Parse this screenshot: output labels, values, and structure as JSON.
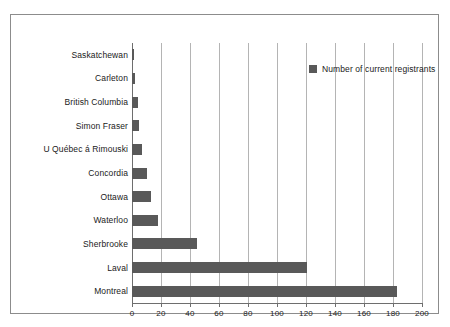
{
  "chart_data": {
    "type": "bar",
    "orientation": "horizontal",
    "title": "",
    "xlabel": "",
    "ylabel": "",
    "xlim": [
      0,
      200
    ],
    "xticks": [
      0,
      20,
      40,
      60,
      80,
      100,
      120,
      140,
      160,
      180,
      200
    ],
    "grid": true,
    "legend": {
      "position": "top-right-inside",
      "entries": [
        {
          "label": "Number of current registrants",
          "color": "#595959"
        }
      ]
    },
    "series": [
      {
        "name": "Number of current registrants",
        "color": "#595959",
        "values": [
          1,
          2,
          4,
          5,
          7,
          10,
          13,
          18,
          45,
          121,
          183
        ]
      }
    ],
    "categories": [
      "Saskatchewan",
      "Carleton",
      "British Columbia",
      "Simon Fraser",
      "U Québec á Rimouski",
      "Concordia",
      "Ottawa",
      "Waterloo",
      "Sherbrooke",
      "Laval",
      "Montreal"
    ]
  },
  "style": {
    "bar_color": "#595959",
    "grid_color": "#b4b4b4",
    "axis_color": "#6e6e6e",
    "frame_color": "#8c8c8c",
    "text_color": "#1a1a1a",
    "background": "#ffffff"
  }
}
